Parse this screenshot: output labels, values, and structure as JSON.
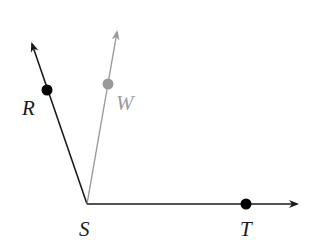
{
  "diagram": {
    "type": "angle-rays",
    "colors": {
      "main": "#1a1a1a",
      "bisector": "#9a9a9a",
      "background": "#ffffff"
    },
    "vertex": {
      "label": "S",
      "x": 87,
      "y": 204
    },
    "rays": [
      {
        "id": "SR",
        "through": "R",
        "tip": {
          "x": 32,
          "y": 42
        },
        "color": "main"
      },
      {
        "id": "SW",
        "through": "W",
        "tip": {
          "x": 117,
          "y": 30
        },
        "color": "bisector"
      },
      {
        "id": "ST",
        "through": "T",
        "tip": {
          "x": 299,
          "y": 204
        },
        "color": "main"
      }
    ],
    "points": [
      {
        "label": "R",
        "x": 47,
        "y": 90,
        "color": "main"
      },
      {
        "label": "W",
        "x": 108,
        "y": 84,
        "color": "bisector"
      },
      {
        "label": "T",
        "x": 246,
        "y": 204,
        "color": "main"
      }
    ],
    "labels": {
      "R": "R",
      "W": "W",
      "S": "S",
      "T": "T"
    }
  }
}
